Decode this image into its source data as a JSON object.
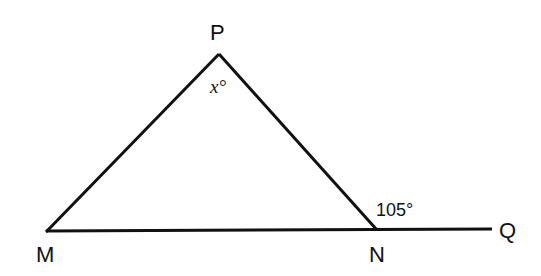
{
  "diagram": {
    "vertices": [
      {
        "id": "P",
        "label": "P"
      },
      {
        "id": "M",
        "label": "M"
      },
      {
        "id": "N",
        "label": "N"
      },
      {
        "id": "Q",
        "label": "Q"
      }
    ],
    "angles": {
      "at_P": "x°",
      "at_N_exterior": "105°"
    },
    "segments": [
      "MP",
      "PN",
      "MN",
      "NQ"
    ],
    "stroke_color": "#111111"
  }
}
